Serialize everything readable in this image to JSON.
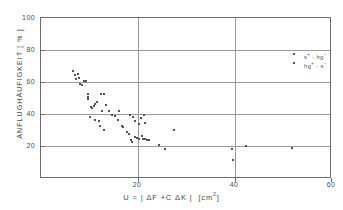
{
  "chart_data": {
    "type": "scatter",
    "title": "",
    "xlabel": "U = | ΔF + C ΔK |   [cm²]",
    "ylabel": "ANFLUGHÄUFIGKEIT [ % ]",
    "xlim": [
      0,
      60
    ],
    "ylim": [
      0,
      100
    ],
    "xticks": [
      20,
      40,
      60
    ],
    "yticks": [
      20,
      40,
      60,
      80,
      100
    ],
    "grid": true,
    "legend_position": "top-right",
    "series": [
      {
        "name": "s⁺ - hg⁻",
        "marker": "dot",
        "color": "#545454",
        "points": [
          [
            6.6,
            67.0
          ],
          [
            7.0,
            64.5
          ],
          [
            7.3,
            62.0
          ],
          [
            7.6,
            65.0
          ],
          [
            7.9,
            63.0
          ],
          [
            8.1,
            59.0
          ],
          [
            8.4,
            58.5
          ],
          [
            8.8,
            61.0
          ],
          [
            9.2,
            61.0
          ],
          [
            9.6,
            52.5
          ],
          [
            9.6,
            51.0
          ],
          [
            9.7,
            49.5
          ],
          [
            10.3,
            45.0
          ],
          [
            10.6,
            44.0
          ],
          [
            11.0,
            45.5
          ],
          [
            11.2,
            46.5
          ],
          [
            11.6,
            48.0
          ],
          [
            12.3,
            53.0
          ],
          [
            13.0,
            53.0
          ],
          [
            10.2,
            38.5
          ],
          [
            11.1,
            36.5
          ],
          [
            11.9,
            36.0
          ],
          [
            12.6,
            42.5
          ],
          [
            13.3,
            46.0
          ],
          [
            14.0,
            42.0
          ],
          [
            12.2,
            33.0
          ],
          [
            13.0,
            30.5
          ],
          [
            14.6,
            39.5
          ],
          [
            15.2,
            39.0
          ],
          [
            16.0,
            42.0
          ],
          [
            15.9,
            36.5
          ],
          [
            16.6,
            33.0
          ],
          [
            17.0,
            32.5
          ],
          [
            18.3,
            40.0
          ],
          [
            19.0,
            38.5
          ],
          [
            19.4,
            36.0
          ],
          [
            20.6,
            38.0
          ],
          [
            21.3,
            39.5
          ]
        ]
      },
      {
        "name": "hg⁺ - s⁻",
        "marker": "dot",
        "color": "#545454",
        "points": [
          [
            17.8,
            29.0
          ],
          [
            18.1,
            28.0
          ],
          [
            18.6,
            24.0
          ],
          [
            18.7,
            23.0
          ],
          [
            19.3,
            26.0
          ],
          [
            19.7,
            25.5
          ],
          [
            20.2,
            25.0
          ],
          [
            20.8,
            26.5
          ],
          [
            21.1,
            25.0
          ],
          [
            21.4,
            25.0
          ],
          [
            21.8,
            24.5
          ],
          [
            22.2,
            24.0
          ],
          [
            20.3,
            34.0
          ],
          [
            21.5,
            34.5
          ],
          [
            24.3,
            21.0
          ],
          [
            25.6,
            18.5
          ],
          [
            27.5,
            30.5
          ],
          [
            39.3,
            18.5
          ],
          [
            39.5,
            11.5
          ],
          [
            42.2,
            20.5
          ],
          [
            51.8,
            19.0
          ]
        ]
      }
    ]
  },
  "axes": {
    "y_tick_labels": [
      "100",
      "80",
      "60",
      "40",
      "20"
    ],
    "x_tick_labels": [
      "20",
      "40",
      "60"
    ]
  },
  "legend": {
    "entries": [
      {
        "label_base1": "s",
        "label_sup1": "+",
        "label_sep": " - ",
        "label_base2": "hg",
        "label_sup2": "−"
      },
      {
        "label_base1": "hg",
        "label_sup1": "+",
        "label_sep": " - ",
        "label_base2": "s",
        "label_sup2": "−"
      }
    ]
  },
  "colors": {
    "marker": "#545454",
    "grid": "#9a9a9a",
    "frame": "#6b6b6b",
    "text": "#4a4a4a"
  }
}
